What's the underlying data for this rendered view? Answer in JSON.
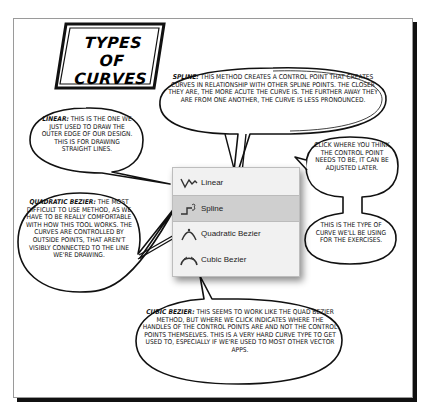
{
  "title": {
    "line1": "TYPES OF",
    "line2": "CURVES"
  },
  "bubbles": {
    "linear": {
      "term": "LINEAR:",
      "text": "THIS IS THE ONE WE JUST USED TO DRAW THE OUTER EDGE OF OUR DESIGN. THIS IS FOR DRAWING STRAIGHT LINES."
    },
    "spline": {
      "term": "SPLINE:",
      "text": "THIS METHOD CREATES A CONTROL POINT THAT CREATES CURVES IN RELATIONSHIP WITH OTHER SPLINE POINTS. THE CLOSER THEY ARE, THE MORE ACUTE THE CURVE IS. THE FURTHER AWAY THEY ARE FROM ONE ANOTHER, THE CURVE IS LESS PRONOUNCED."
    },
    "click_where": {
      "text": "CLICK WHERE YOU THINK THE CONTROL POINT NEEDS TO BE, IT CAN BE ADJUSTED LATER."
    },
    "exercises": {
      "text": "THIS IS THE TYPE OF CURVE WE'LL BE USING FOR THE EXERCISES."
    },
    "quadratic": {
      "term": "QUADRATIC BEZIER:",
      "text": "THE MOST DIFFICULT TO USE METHOD, AS WE HAVE TO BE REALLY COMFORTABLE WITH HOW THIS TOOL WORKS. THE CURVES ARE CONTROLLED BY OUTSIDE POINTS, THAT AREN'T VISIBLY CONNECTED TO THE LINE WE'RE DRAWING."
    },
    "cubic": {
      "term": "CUBIC BEZIER:",
      "text": "THIS SEEMS TO WORK LIKE THE QUAD BEZIER METHOD, BUT WHERE WE CLICK INDICATES WHERE THE HANDLES OF THE CONTROL POINTS ARE AND NOT THE CONTROL POINTS THEMSELVES. THIS IS A VERY HARD CURVE TYPE TO GET USED TO, ESPECIALLY IF WE'RE USED TO MOST OTHER VECTOR APPS."
    }
  },
  "menu": {
    "selected_index": 1,
    "items": [
      {
        "label": "Linear",
        "icon": "linear-curve-icon"
      },
      {
        "label": "Spline",
        "icon": "spline-curve-icon"
      },
      {
        "label": "Quadratic Bezier",
        "icon": "quadratic-bezier-icon"
      },
      {
        "label": "Cubic Bezier",
        "icon": "cubic-bezier-icon"
      }
    ]
  },
  "colors": {
    "ink": "#111111",
    "menu_bg": "#f1f1f1",
    "menu_selected": "#cfcfcf"
  }
}
